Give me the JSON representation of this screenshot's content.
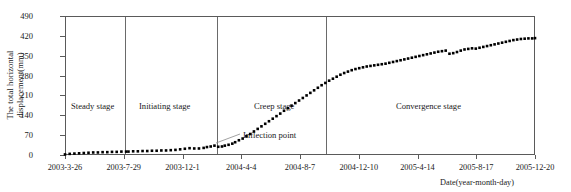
{
  "chart_data": {
    "type": "scatter",
    "title": "",
    "xlabel": "Date(year-month-day)",
    "ylabel": "The total horizontal displacement(mm)",
    "ylabel_line1": "The total horizontal",
    "ylabel_line2": "displacement(mm)",
    "ylim": [
      0,
      490
    ],
    "yticks": [
      0,
      70,
      140,
      210,
      280,
      350,
      420,
      490
    ],
    "xticks": [
      "2003-3-26",
      "2003-7-29",
      "2003-12-1",
      "2004-4-4",
      "2004-8-7",
      "2004-12-10",
      "2005-4-14",
      "2005-8-17",
      "2005-12-20"
    ],
    "grid": false,
    "legend": "none",
    "marker": "filled-square",
    "marker_color": "#000000",
    "series": [
      {
        "name": "Total horizontal displacement",
        "x_fraction": [
          0.0,
          0.01,
          0.02,
          0.03,
          0.04,
          0.05,
          0.06,
          0.07,
          0.08,
          0.09,
          0.1,
          0.11,
          0.12,
          0.13,
          0.135,
          0.145,
          0.155,
          0.165,
          0.175,
          0.185,
          0.195,
          0.205,
          0.215,
          0.225,
          0.235,
          0.245,
          0.255,
          0.265,
          0.275,
          0.285,
          0.295,
          0.302,
          0.31,
          0.318,
          0.326,
          0.334,
          0.34,
          0.348,
          0.356,
          0.362,
          0.37,
          0.378,
          0.386,
          0.394,
          0.402,
          0.41,
          0.418,
          0.426,
          0.434,
          0.442,
          0.45,
          0.458,
          0.466,
          0.474,
          0.482,
          0.49,
          0.498,
          0.506,
          0.514,
          0.522,
          0.53,
          0.538,
          0.546,
          0.554,
          0.562,
          0.57,
          0.578,
          0.586,
          0.594,
          0.602,
          0.61,
          0.618,
          0.626,
          0.634,
          0.642,
          0.65,
          0.658,
          0.666,
          0.674,
          0.682,
          0.69,
          0.698,
          0.706,
          0.714,
          0.722,
          0.73,
          0.738,
          0.746,
          0.754,
          0.762,
          0.77,
          0.778,
          0.786,
          0.794,
          0.802,
          0.81,
          0.818,
          0.826,
          0.834,
          0.842,
          0.85,
          0.858,
          0.866,
          0.874,
          0.882,
          0.89,
          0.898,
          0.906,
          0.914,
          0.922,
          0.93,
          0.938,
          0.946,
          0.954,
          0.962,
          0.97,
          0.978,
          0.986,
          0.994,
          1.0
        ],
        "values": [
          2,
          4,
          5,
          6,
          7,
          8,
          9,
          9,
          10,
          10,
          11,
          11,
          12,
          12,
          12,
          13,
          13,
          14,
          14,
          15,
          15,
          16,
          16,
          17,
          18,
          20,
          22,
          24,
          23,
          23,
          25,
          28,
          30,
          33,
          29,
          30,
          33,
          36,
          40,
          45,
          52,
          58,
          66,
          74,
          83,
          92,
          101,
          110,
          119,
          128,
          137,
          146,
          156,
          165,
          174,
          183,
          192,
          201,
          210,
          219,
          228,
          237,
          246,
          254,
          262,
          269,
          276,
          283,
          289,
          294,
          299,
          303,
          306,
          309,
          312,
          314,
          316,
          318,
          320,
          322,
          325,
          328,
          331,
          334,
          337,
          340,
          343,
          346,
          349,
          352,
          355,
          358,
          361,
          364,
          366,
          368,
          357,
          359,
          363,
          368,
          372,
          374,
          376,
          375,
          378,
          381,
          384,
          387,
          390,
          393,
          396,
          399,
          402,
          405,
          407,
          409,
          410,
          411,
          411,
          412
        ]
      }
    ],
    "stages": [
      {
        "label": "Steady stage"
      },
      {
        "label": "Initiating stage"
      },
      {
        "label": "Creep stage"
      },
      {
        "label": "Convergence stage"
      }
    ],
    "annotations": [
      {
        "label": "Inflection point"
      }
    ]
  }
}
